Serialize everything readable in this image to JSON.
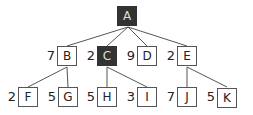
{
  "tree": {
    "root": {
      "id": "A",
      "label": "A",
      "highlighted": true
    },
    "level1": [
      {
        "id": "B",
        "label": "B",
        "weight": "7",
        "highlighted": false
      },
      {
        "id": "C",
        "label": "C",
        "weight": "2",
        "highlighted": true
      },
      {
        "id": "D",
        "label": "D",
        "weight": "9",
        "highlighted": false
      },
      {
        "id": "E",
        "label": "E",
        "weight": "2",
        "highlighted": false
      }
    ],
    "level2": [
      {
        "id": "F",
        "label": "F",
        "weight": "2",
        "parent": "B"
      },
      {
        "id": "G",
        "label": "G",
        "weight": "5",
        "parent": "B"
      },
      {
        "id": "H",
        "label": "H",
        "weight": "5",
        "parent": "C"
      },
      {
        "id": "I",
        "label": "I",
        "weight": "3",
        "parent": "C"
      },
      {
        "id": "J",
        "label": "J",
        "weight": "7",
        "parent": "E"
      },
      {
        "id": "K",
        "label": "K",
        "weight": "5",
        "parent": "E"
      }
    ],
    "colors": {
      "highlight": "#333333",
      "border": "#555555",
      "edge": "#555555"
    }
  }
}
